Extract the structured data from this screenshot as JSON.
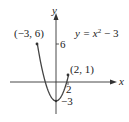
{
  "chart_data": {
    "type": "line",
    "title": "",
    "equation": "y = x² − 3",
    "xlabel": "x",
    "ylabel": "y",
    "function": "x^2 - 3",
    "domain": [
      -3,
      2
    ],
    "x": [
      -3,
      -2.5,
      -2,
      -1.5,
      -1,
      -0.5,
      0,
      0.5,
      1,
      1.5,
      2
    ],
    "values": [
      6,
      3.25,
      1,
      -0.75,
      -2,
      -2.75,
      -3,
      -2.75,
      -2,
      -0.75,
      1
    ],
    "endpoints": [
      {
        "label": "(−3, 6)",
        "x": -3,
        "y": 6
      },
      {
        "label": "(2, 1)",
        "x": 2,
        "y": 1
      }
    ],
    "tick_labels": {
      "y": [
        "6",
        "−3"
      ],
      "x": [
        "2"
      ]
    },
    "grid": false
  },
  "labels": {
    "y_axis": "y",
    "x_axis": "x",
    "equation_lhs": "y = x",
    "equation_exp": "2",
    "equation_rhs": " − 3",
    "point_left": "(−3, 6)",
    "point_right": "(2, 1)",
    "tick_y6": "6",
    "tick_ym3": "−3",
    "tick_x2": "2"
  }
}
